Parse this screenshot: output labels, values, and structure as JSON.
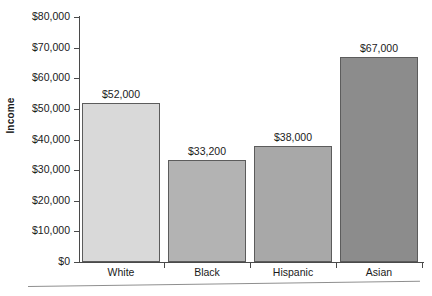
{
  "chart_data": {
    "type": "bar",
    "title": "",
    "xlabel": "",
    "ylabel": "Income",
    "categories": [
      "White",
      "Black",
      "Hispanic",
      "Asian"
    ],
    "values": [
      52000,
      33200,
      38000,
      67000
    ],
    "value_labels": [
      "$52,000",
      "$33,200",
      "$38,000",
      "$67,000"
    ],
    "ylim": [
      0,
      80000
    ],
    "ytick_values": [
      0,
      10000,
      20000,
      30000,
      40000,
      50000,
      60000,
      70000,
      80000
    ],
    "ytick_labels": [
      "$0",
      "$10,000",
      "$20,000",
      "$30,000",
      "$40,000",
      "$50,000",
      "$60,000",
      "$70,000",
      "$80,000"
    ],
    "grid": false,
    "legend": false,
    "bar_colors": [
      "#d9d9d9",
      "#b3b3b3",
      "#a8a8a8",
      "#8c8c8c"
    ],
    "bar_border_color": "#5c5c5c",
    "axis_color": "#4a4a4a",
    "text_color": "#1a1a1a",
    "background": "#ffffff"
  },
  "axis": {
    "y_title": "Income"
  }
}
